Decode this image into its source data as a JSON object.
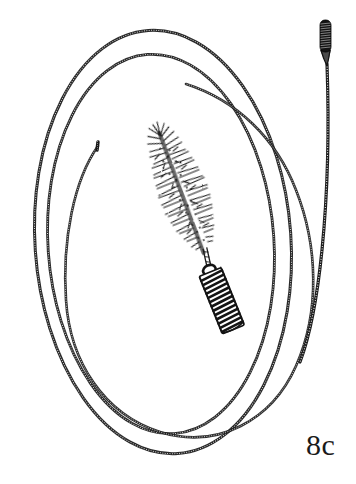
{
  "figure": {
    "label": "8c",
    "domain": "line-art-illustration",
    "background_color": "#ffffff",
    "ink_color": "#1a1a1a",
    "canvas": {
      "width": 356,
      "height": 484
    }
  },
  "objects": {
    "coiled_cable_loop": {
      "name": "coiled flexible cable wound into an oval coil",
      "loop_count": 3,
      "texture": "fine transverse cross-hatch representing tight wire coil",
      "stroke_color": "#1f1f1f",
      "stroke_width": 1.4,
      "center": {
        "x": 163,
        "y": 242
      },
      "loops": [
        {
          "rx": 128,
          "ry": 212,
          "rotation": -4,
          "stroke_width": 1.5
        },
        {
          "rx": 113,
          "ry": 190,
          "rotation": -4,
          "stroke_width": 1.4
        },
        {
          "rx": 97,
          "ry": 167,
          "rotation": -5,
          "stroke_width": 1.3
        }
      ],
      "free_end": {
        "name": "tapered free end of inner cable",
        "x": 98,
        "y": 142,
        "description": "inner coil terminates in a short blunt tip near upper-left interior"
      }
    },
    "bristle_brush": {
      "name": "spiral bristle brush head with coiled spring handle",
      "angle_degrees": -22,
      "head": {
        "name": "bristle head",
        "length": 130,
        "max_width": 34,
        "tip": {
          "x": 200,
          "y": 133
        },
        "base": {
          "x": 161,
          "y": 262
        },
        "bristle_count": 240,
        "bristle_length_range": [
          6,
          17
        ],
        "description": "dense radiating spiky bristles tapering toward the tip"
      },
      "shank": {
        "name": "twisted wire shank",
        "from": {
          "x": 166,
          "y": 248
        },
        "to": {
          "x": 156,
          "y": 272
        }
      },
      "handle": {
        "name": "coiled spring handle",
        "top": {
          "x": 156,
          "y": 268
        },
        "bottom": {
          "x": 148,
          "y": 330
        },
        "width": 22,
        "coil_turns": 14,
        "eyelet": {
          "name": "eyelet loop at top of handle",
          "cx": 157,
          "cy": 271,
          "r": 5
        }
      }
    },
    "spring_tip_probe": {
      "name": "spring-tipped flexible cable probe",
      "tip": {
        "name": "dark coiled spring tip",
        "x": 324,
        "y": 20,
        "width": 10,
        "height": 32,
        "coil_turns": 12,
        "fill": "#151515",
        "description": "solid dark tightly-wound coil cylinder, rounded top"
      },
      "taper": {
        "name": "tapered ferrule below spring tip",
        "from_y": 52,
        "to_y": 68
      },
      "cable": {
        "name": "flexible coiled cable shaft",
        "start": {
          "x": 328,
          "y": 66
        },
        "end": {
          "x": 300,
          "y": 360
        },
        "texture": "fine transverse cross-hatch coil banding",
        "stroke_width": 2.2
      }
    }
  }
}
